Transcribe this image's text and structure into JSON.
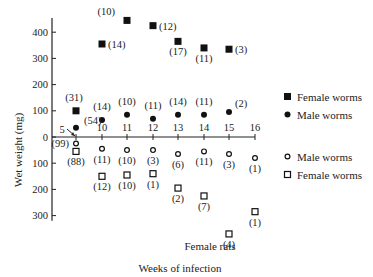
{
  "chart_data": {
    "type": "scatter",
    "title": "",
    "xlabel": "Weeks of infection",
    "ylabel": "Wet weight (mg)",
    "subtitle_below": "Female rats",
    "x_ticks": [
      5,
      10,
      11,
      12,
      13,
      14,
      15,
      16
    ],
    "y_ticks_above": [
      0,
      100,
      200,
      300,
      400
    ],
    "y_ticks_below": [
      100,
      200,
      300
    ],
    "ylim": [
      -300,
      450
    ],
    "grid": false,
    "legend_upper": [
      {
        "marker": "filled-square",
        "label": "Female worms"
      },
      {
        "marker": "filled-circle",
        "label": "Male worms"
      }
    ],
    "legend_lower": [
      {
        "marker": "open-circle",
        "label": "Male worms"
      },
      {
        "marker": "open-square",
        "label": "Female worms"
      }
    ],
    "annotation": "5",
    "series": [
      {
        "name": "Female worms (upper, filled squares)",
        "side": "above",
        "x": [
          5,
          10,
          11,
          12,
          13,
          14,
          15
        ],
        "values": [
          100,
          355,
          445,
          425,
          365,
          340,
          335
        ],
        "n_labels": [
          "(31)",
          "(14)",
          "(10)",
          "(12)",
          "(17)",
          "(11)",
          "(3)"
        ]
      },
      {
        "name": "Male worms (upper, filled circles)",
        "side": "above",
        "x": [
          5,
          10,
          11,
          12,
          13,
          14,
          15
        ],
        "values": [
          35,
          65,
          85,
          70,
          85,
          85,
          95
        ],
        "n_labels": [
          "(54)",
          "(14)",
          "(10)",
          "(11)",
          "(14)",
          "(11)",
          "(2)"
        ]
      },
      {
        "name": "Male worms (lower, open circles)",
        "side": "below",
        "x": [
          5,
          10,
          11,
          12,
          13,
          14,
          15,
          16
        ],
        "values": [
          25,
          45,
          50,
          50,
          65,
          55,
          65,
          80
        ],
        "n_labels": [
          "(99)",
          "(11)",
          "(10)",
          "(3)",
          "(6)",
          "(11)",
          "(3)",
          "(1)"
        ]
      },
      {
        "name": "Female worms (lower, open squares)",
        "side": "below",
        "x": [
          5,
          10,
          11,
          12,
          13,
          14,
          15,
          16
        ],
        "values": [
          55,
          150,
          145,
          140,
          195,
          225,
          370,
          285
        ],
        "n_labels": [
          "(88)",
          "(12)",
          "(10)",
          "(1)",
          "(2)",
          "(7)",
          "(4)",
          "(1)"
        ]
      }
    ]
  }
}
